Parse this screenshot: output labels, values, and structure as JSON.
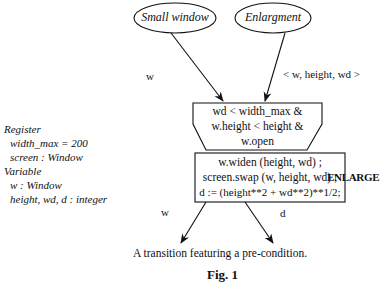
{
  "diagram": {
    "places": [
      {
        "id": "small-window",
        "label": "Small window"
      },
      {
        "id": "enlargment",
        "label": "Enlargment"
      }
    ],
    "input_arcs": [
      {
        "from": "small-window",
        "label": "w"
      },
      {
        "from": "enlargment",
        "label": "< w, height, wd >"
      }
    ],
    "precondition": {
      "lines": [
        "wd < width_max &",
        "w.height < height &",
        "w.open"
      ]
    },
    "action": {
      "lines": [
        "w.widen (height, wd) ;",
        "screen.swap (w, height, wd) ;",
        "d :=  (height**2 + wd**2)**1/2;"
      ]
    },
    "transition_name": "ENLARGE",
    "output_arcs": [
      {
        "label": "w"
      },
      {
        "label": "d"
      }
    ],
    "declarations": {
      "register_heading": "Register",
      "register_items": [
        "width_max = 200",
        "screen : Window"
      ],
      "variable_heading": "Variable",
      "variable_items": [
        "w : Window",
        "height, wd, d : integer"
      ]
    },
    "caption": "A transition featuring a pre-condition.",
    "figure_label": "Fig. 1"
  }
}
